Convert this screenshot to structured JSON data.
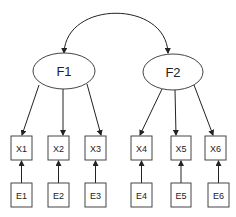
{
  "diagram": {
    "type": "confirmatory-factor-analysis",
    "factors": [
      {
        "id": "F1",
        "label": "F1"
      },
      {
        "id": "F2",
        "label": "F2"
      }
    ],
    "indicators": [
      {
        "id": "X1",
        "label": "X1",
        "factor": "F1",
        "error": "E1"
      },
      {
        "id": "X2",
        "label": "X2",
        "factor": "F1",
        "error": "E2"
      },
      {
        "id": "X3",
        "label": "X3",
        "factor": "F1",
        "error": "E3"
      },
      {
        "id": "X4",
        "label": "X4",
        "factor": "F2",
        "error": "E4"
      },
      {
        "id": "X5",
        "label": "X5",
        "factor": "F2",
        "error": "E5"
      },
      {
        "id": "X6",
        "label": "X6",
        "factor": "F2",
        "error": "E6"
      }
    ],
    "errors": [
      {
        "id": "E1",
        "label": "E1"
      },
      {
        "id": "E2",
        "label": "E2"
      },
      {
        "id": "E3",
        "label": "E3"
      },
      {
        "id": "E4",
        "label": "E4"
      },
      {
        "id": "E5",
        "label": "E5"
      },
      {
        "id": "E6",
        "label": "E6"
      }
    ],
    "covariances": [
      {
        "from": "F1",
        "to": "F2",
        "style": "double-headed-curved"
      }
    ]
  }
}
